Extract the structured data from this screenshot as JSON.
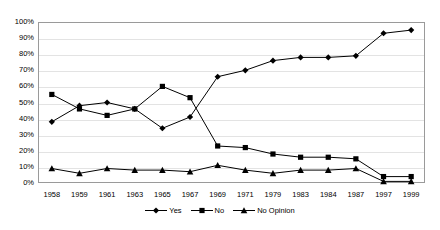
{
  "chart_data": {
    "type": "line",
    "title": "",
    "xlabel": "",
    "ylabel": "",
    "ylim": [
      0,
      100
    ],
    "ytick_labels": [
      "100%",
      "90%",
      "80%",
      "70%",
      "60%",
      "50%",
      "40%",
      "30%",
      "20%",
      "10%",
      "0%"
    ],
    "ytick_values": [
      100,
      90,
      80,
      70,
      60,
      50,
      40,
      30,
      20,
      10,
      0
    ],
    "grid": true,
    "legend_position": "bottom",
    "categories": [
      "1958",
      "1959",
      "1961",
      "1963",
      "1965",
      "1967",
      "1969",
      "1971",
      "1979",
      "1983",
      "1984",
      "1987",
      "1997",
      "1999"
    ],
    "series": [
      {
        "name": "Yes",
        "marker": "diamond",
        "color": "#000000",
        "values": [
          38,
          48,
          50,
          46,
          34,
          41,
          66,
          70,
          76,
          78,
          78,
          79,
          93,
          95
        ]
      },
      {
        "name": "No",
        "marker": "square",
        "color": "#000000",
        "values": [
          55,
          46,
          42,
          46,
          60,
          53,
          23,
          22,
          18,
          16,
          16,
          15,
          4,
          4
        ]
      },
      {
        "name": "No Opinion",
        "marker": "triangle",
        "color": "#000000",
        "values": [
          9,
          6,
          9,
          8,
          8,
          7,
          11,
          8,
          6,
          8,
          8,
          9,
          1,
          1
        ]
      }
    ]
  }
}
